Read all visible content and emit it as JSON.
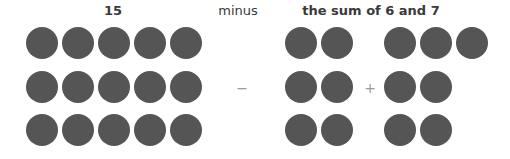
{
  "labels": {
    "left": "15",
    "middle": "minus",
    "right": "the sum of 6 and 7"
  },
  "operators": {
    "minus": "−",
    "plus": "+"
  },
  "colors": {
    "dot": "#555555",
    "label": "#3a3a3a",
    "operator": "#9a9a9a"
  },
  "groups": {
    "fifteen": {
      "count": 15,
      "rows": 3,
      "cols": 5
    },
    "six": {
      "count": 6,
      "rows": 3,
      "cols": 2
    },
    "seven": {
      "count": 7,
      "row_counts": [
        3,
        2,
        2
      ]
    }
  }
}
